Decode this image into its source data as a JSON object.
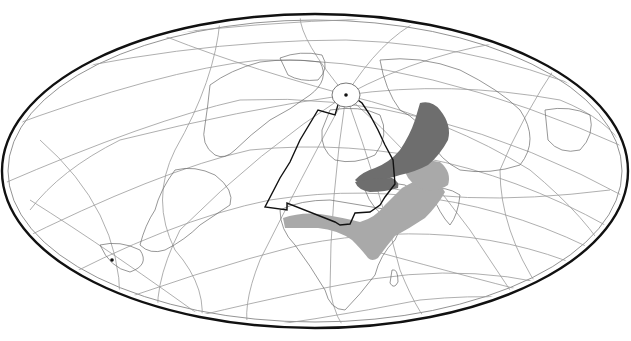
{
  "map": {
    "projection": "oblique-hammer-ellipse",
    "frame": {
      "cx": 315,
      "cy": 171,
      "rx": 313,
      "ry": 157
    },
    "colors": {
      "background": "#ffffff",
      "frame": "#111111",
      "graticule": "#9a9a9a",
      "coastline": "#6a6a6a",
      "range_dark": "#6e6e6e",
      "range_light": "#a9a9a9",
      "zone_outline": "#111111"
    },
    "markers": [
      {
        "name": "north-pole-point",
        "x": 346,
        "y": 95
      },
      {
        "name": "south-point",
        "x": 112,
        "y": 260
      }
    ],
    "layers": [
      {
        "id": "graticule",
        "label": ""
      },
      {
        "id": "coastlines",
        "label": ""
      },
      {
        "id": "range-dark",
        "label": ""
      },
      {
        "id": "range-light",
        "label": ""
      },
      {
        "id": "zone-outline",
        "label": ""
      }
    ]
  }
}
